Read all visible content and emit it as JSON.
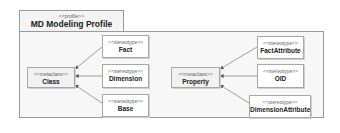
{
  "package": {
    "stereotype": "<<profile>>",
    "name": "MD Modeling Profile"
  },
  "metaclasses": [
    {
      "stereotype": "<<metaclass>>",
      "name": "Class"
    },
    {
      "stereotype": "<<metaclass>>",
      "name": "Property"
    }
  ],
  "stereotypes": [
    {
      "stereotype": "<<stereotype>>",
      "name": "Fact",
      "extends": "Class"
    },
    {
      "stereotype": "<<stereotype>>",
      "name": "Dimension",
      "extends": "Class"
    },
    {
      "stereotype": "<<stereotype>>",
      "name": "Base",
      "extends": "Class"
    },
    {
      "stereotype": "<<stereotype>>",
      "name": "FactAttribute",
      "extends": "Property"
    },
    {
      "stereotype": "<<stereotype>>",
      "name": "OID",
      "extends": "Property"
    },
    {
      "stereotype": "<<stereotype>>",
      "name": "DimensionAttribute",
      "extends": "Property"
    }
  ],
  "colors": {
    "line": "#888888",
    "border": "#a8a8a8",
    "package_bg": "#f7f7f7"
  }
}
